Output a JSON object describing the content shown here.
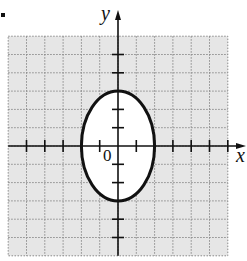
{
  "chart_data": {
    "type": "line",
    "title": "",
    "xlabel": "x",
    "ylabel": "y",
    "origin_label": "0",
    "xlim": [
      -6,
      6
    ],
    "ylim": [
      -6,
      6
    ],
    "grid": true,
    "grid_step": 1,
    "ticks": {
      "x": [
        -5,
        -4,
        -3,
        -2,
        -1,
        1,
        2,
        3,
        4,
        5,
        6
      ],
      "y": [
        -5,
        -4,
        -3,
        -2,
        -1,
        1,
        2,
        3,
        4,
        5
      ]
    },
    "series": [
      {
        "name": "ellipse",
        "shape": "ellipse",
        "center": [
          0,
          0
        ],
        "semi_axis_x": 2,
        "semi_axis_y": 3,
        "equation": "x^2/4 + y^2/9 = 1"
      }
    ]
  },
  "colors": {
    "grid_bg": "#e6e6e6",
    "grid_line": "#8a8a8a",
    "curve": "#111111",
    "interior": "#ffffff"
  }
}
